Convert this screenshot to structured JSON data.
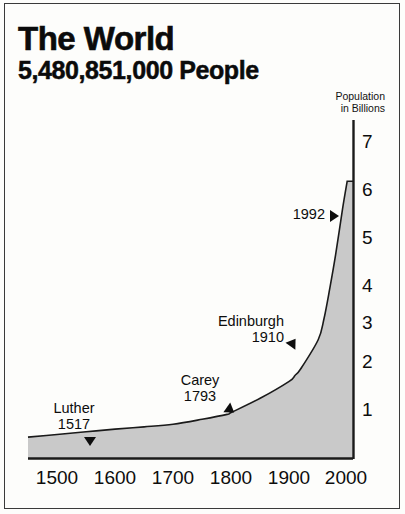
{
  "title": {
    "line1": "The World",
    "line2": "5,480,851,000 People"
  },
  "axis_caption": {
    "line1": "Population",
    "line2": "in Billions"
  },
  "chart_data": {
    "type": "area",
    "subtitle": "Population in Billions",
    "xlabel": "",
    "ylabel": "Population in Billions",
    "xlim": [
      1450,
      2010
    ],
    "ylim": [
      0,
      7.4
    ],
    "grid": false,
    "legend": "none",
    "fill_color": "#c9c9c9",
    "line_color": "#1a1a1a",
    "x_ticks": [
      1500,
      1600,
      1700,
      1800,
      1900,
      2000
    ],
    "x_tick_labels": [
      "1500",
      "1600",
      "1700",
      "1800",
      "1900",
      "2000"
    ],
    "y_ticks": [
      1,
      2,
      3,
      4,
      5,
      6,
      7
    ],
    "y_tick_labels": [
      "1",
      "2",
      "3",
      "4",
      "5",
      "6",
      "7"
    ],
    "x": [
      1450,
      1500,
      1550,
      1600,
      1650,
      1700,
      1750,
      1793,
      1800,
      1850,
      1900,
      1910,
      1920,
      1950,
      1960,
      1970,
      1980,
      1992,
      2000
    ],
    "values": [
      0.37,
      0.43,
      0.49,
      0.55,
      0.6,
      0.66,
      0.77,
      0.88,
      0.92,
      1.24,
      1.62,
      1.75,
      1.9,
      2.55,
      3.02,
      3.7,
      4.45,
      5.48,
      6.1
    ],
    "series": [
      {
        "name": "World population",
        "values": [
          0.37,
          0.43,
          0.49,
          0.55,
          0.6,
          0.66,
          0.77,
          0.88,
          0.92,
          1.24,
          1.62,
          1.75,
          1.9,
          2.55,
          3.02,
          3.7,
          4.45,
          5.48,
          6.1
        ]
      }
    ],
    "annotations": [
      {
        "id": "luther",
        "label": "Luther",
        "year": "1517",
        "x": 1517,
        "y": 0.5,
        "marker": "triangle-down"
      },
      {
        "id": "carey",
        "label": "Carey",
        "year": "1793",
        "x": 1793,
        "y": 0.88,
        "marker": "triangle-down-left"
      },
      {
        "id": "edinburgh",
        "label": "Edinburgh",
        "year": "1910",
        "x": 1910,
        "y": 1.75,
        "marker": "triangle-up-right"
      },
      {
        "id": "present",
        "label": "",
        "year": "1992",
        "x": 1992,
        "y": 5.48,
        "marker": "triangle-right"
      }
    ]
  }
}
